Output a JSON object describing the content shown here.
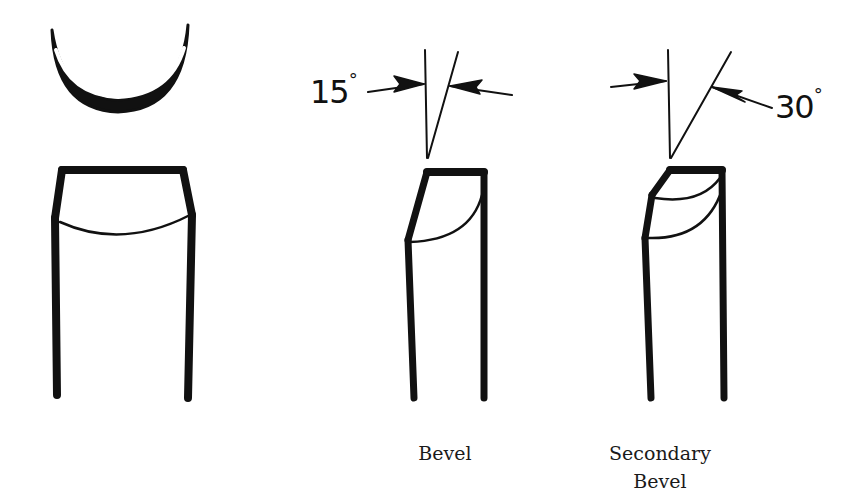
{
  "figure": {
    "panels": [
      {
        "id": "gouge",
        "label": "",
        "parts": [
          "cross-section",
          "front-view"
        ]
      },
      {
        "id": "bevel",
        "label": "Bevel",
        "angle": {
          "value": "15",
          "unit": "°"
        }
      },
      {
        "id": "secondary-bevel",
        "label_line1": "Secondary",
        "label_line2": "Bevel",
        "angle": {
          "value": "30",
          "unit": "°"
        }
      }
    ],
    "colors": {
      "ink": "#111111",
      "background": "#ffffff"
    }
  }
}
